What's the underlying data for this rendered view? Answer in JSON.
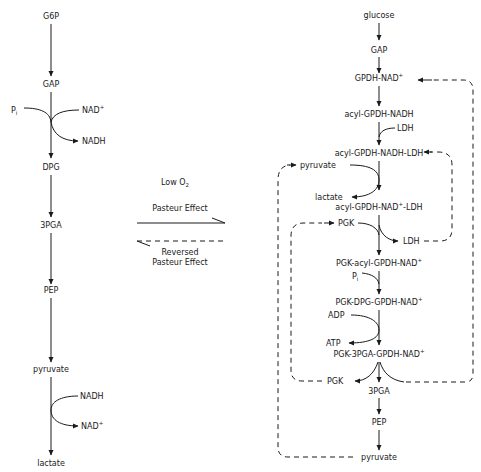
{
  "left_pathway": {
    "nodes": [
      "G6P",
      "GAP",
      "DPG",
      "3PGA",
      "PEP",
      "pyruvate",
      "lactate"
    ],
    "gap_step": {
      "in1": "P",
      "in1_sub": "i",
      "in2": "NAD",
      "in2_sup": "+",
      "out": "NADH"
    },
    "pyruvate_step": {
      "in": "NADH",
      "out": "NAD",
      "out_sup": "+"
    }
  },
  "middle": {
    "condition": "Low O",
    "condition_sub": "2",
    "forward_label": "Pasteur Effect",
    "reverse_label_line1": "Reversed",
    "reverse_label_line2": "Pasteur Effect"
  },
  "right_pathway": {
    "glucose": "glucose",
    "gap": "GAP",
    "gpdh_nad": "GPDH-NAD",
    "gpdh_nad_sup": "+",
    "acyl_gpdh_nadh": "acyl-GPDH-NADH",
    "ldh_in": "LDH",
    "acyl_gpdh_nadh_ldh": "acyl-GPDH-NADH-LDH",
    "pyruvate_in": "pyruvate",
    "lactate_out": "lactate",
    "acyl_gpdh_nad_ldh_a": "acyl-GPDH-NAD",
    "acyl_gpdh_nad_ldh_sup": "+",
    "acyl_gpdh_nad_ldh_b": "-LDH",
    "pgk_in": "PGK",
    "ldh_out": "LDH",
    "pgk_acyl": "PGK-acyl-GPDH-NAD",
    "pgk_acyl_sup": "+",
    "pi": "P",
    "pi_sub": "i",
    "pgk_dpg": "PGK-DPG-GPDH-NAD",
    "pgk_dpg_sup": "+",
    "adp": "ADP",
    "atp": "ATP",
    "pgk_3pga": "PGK-3PGA-GPDH-NAD",
    "pgk_3pga_sup": "+",
    "pgk_out": "PGK",
    "pga3": "3PGA",
    "pep": "PEP",
    "pyruvate_out": "pyruvate"
  }
}
